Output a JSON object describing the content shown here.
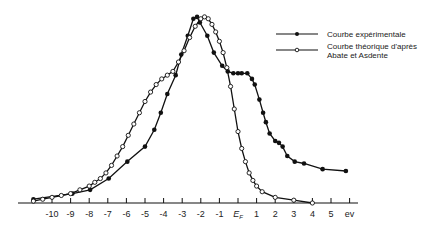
{
  "chart_data": {
    "type": "line",
    "title": "",
    "xlabel": "ev",
    "ylabel": "",
    "xlim": [
      -11.2,
      6
    ],
    "ylim": [
      0,
      1
    ],
    "grid": false,
    "legend_position": "top-right",
    "x_ticks": [
      "-10",
      "-9",
      "-8",
      "-7",
      "-6",
      "-5",
      "-4",
      "-3",
      "-2",
      "-1",
      "E_F",
      "1",
      "2",
      "3",
      "4",
      "5",
      "ev"
    ],
    "x_tick_values": [
      -10,
      -9,
      -8,
      -7,
      -6,
      -5,
      -4,
      -3,
      -2,
      -1,
      0,
      1,
      2,
      3,
      4,
      5,
      6
    ],
    "series": [
      {
        "name": "Courbe expérimentale",
        "marker": "filled-circle",
        "x": [
          -11.0,
          -8.9,
          -7.95,
          -6.95,
          -5.95,
          -5.0,
          -4.5,
          -4.15,
          -3.8,
          -3.35,
          -3.05,
          -2.7,
          -2.4,
          -2.2,
          -2.05,
          -1.65,
          -1.3,
          -0.85,
          -0.55,
          -0.25,
          0.0,
          0.2,
          0.5,
          0.75,
          0.9,
          1.15,
          1.35,
          1.5,
          1.7,
          2.0,
          2.2,
          2.4,
          2.65,
          3.05,
          3.55,
          4.55,
          5.8
        ],
        "y": [
          0.02,
          0.05,
          0.07,
          0.13,
          0.22,
          0.3,
          0.39,
          0.48,
          0.58,
          0.68,
          0.79,
          0.89,
          0.98,
          0.99,
          0.96,
          0.89,
          0.8,
          0.73,
          0.7,
          0.69,
          0.69,
          0.69,
          0.69,
          0.66,
          0.63,
          0.55,
          0.48,
          0.43,
          0.37,
          0.33,
          0.32,
          0.3,
          0.25,
          0.22,
          0.21,
          0.18,
          0.17
        ]
      },
      {
        "name": "Courbe théorique d'après Abate et Asdente",
        "marker": "open-circle",
        "x": [
          -11.0,
          -10.5,
          -10.0,
          -9.5,
          -9.0,
          -8.5,
          -8.0,
          -7.7,
          -7.4,
          -7.1,
          -6.8,
          -6.5,
          -6.2,
          -5.9,
          -5.6,
          -5.3,
          -5.0,
          -4.7,
          -4.4,
          -4.1,
          -3.8,
          -3.5,
          -3.2,
          -2.9,
          -2.6,
          -2.3,
          -2.0,
          -1.8,
          -1.6,
          -1.4,
          -1.2,
          -1.0,
          -0.8,
          -0.6,
          -0.4,
          -0.2,
          0.0,
          0.2,
          0.4,
          0.6,
          0.8,
          1.0,
          1.3,
          2.0,
          3.0,
          4.0
        ],
        "y": [
          0.01,
          0.02,
          0.03,
          0.04,
          0.05,
          0.07,
          0.09,
          0.11,
          0.13,
          0.16,
          0.2,
          0.25,
          0.3,
          0.36,
          0.42,
          0.48,
          0.54,
          0.59,
          0.63,
          0.66,
          0.68,
          0.7,
          0.75,
          0.81,
          0.88,
          0.94,
          0.98,
          0.99,
          0.98,
          0.95,
          0.91,
          0.86,
          0.8,
          0.72,
          0.62,
          0.5,
          0.38,
          0.29,
          0.22,
          0.16,
          0.12,
          0.09,
          0.06,
          0.03,
          0.015,
          0.0
        ]
      }
    ]
  },
  "legend": {
    "items": [
      {
        "line1": "Courbe expérimentale",
        "line2": ""
      },
      {
        "line1": "Courbe théorique d'après",
        "line2": "Abate et Asdente"
      }
    ]
  },
  "axis": {
    "unit_label": "ev",
    "fermi_label": "E",
    "fermi_sub": "F"
  }
}
